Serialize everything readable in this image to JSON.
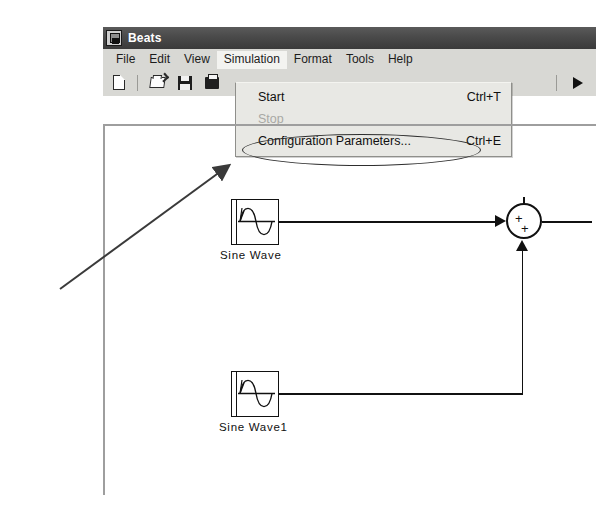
{
  "window": {
    "title": "Beats",
    "title_icon": "simulink-model-icon"
  },
  "menubar": {
    "items": [
      {
        "label": "File",
        "open": false
      },
      {
        "label": "Edit",
        "open": false
      },
      {
        "label": "View",
        "open": false
      },
      {
        "label": "Simulation",
        "open": true
      },
      {
        "label": "Format",
        "open": false
      },
      {
        "label": "Tools",
        "open": false
      },
      {
        "label": "Help",
        "open": false
      }
    ]
  },
  "toolbar": {
    "icons": [
      {
        "name": "new-model-icon",
        "glyph": "new"
      },
      {
        "name": "open-model-icon",
        "glyph": "open"
      },
      {
        "name": "save-model-icon",
        "glyph": "save"
      },
      {
        "name": "print-model-icon",
        "glyph": "print"
      },
      {
        "name": "start-simulation-icon",
        "glyph": "run"
      }
    ]
  },
  "simulation_menu": {
    "items": [
      {
        "label": "Start",
        "accel": "Ctrl+T",
        "disabled": false
      },
      {
        "label": "Stop",
        "accel": "",
        "disabled": true
      },
      {
        "label": "Configuration Parameters...",
        "accel": "Ctrl+E",
        "disabled": false
      }
    ]
  },
  "annotations": {
    "highlight_ellipse_target": "Configuration Parameters...",
    "pointer_arrow": "arrow-pointing-to-configuration-parameters"
  },
  "canvas": {
    "blocks": [
      {
        "name": "sine-wave-block",
        "label": "Sine Wave",
        "type": "Sine Wave"
      },
      {
        "name": "sine-wave1-block",
        "label": "Sine Wave1",
        "type": "Sine Wave"
      },
      {
        "name": "sum-block",
        "label": "",
        "type": "Sum",
        "signs": [
          "+",
          "+"
        ]
      }
    ],
    "signals": [
      {
        "from": "Sine Wave",
        "to": "Sum",
        "port": "input-1"
      },
      {
        "from": "Sine Wave1",
        "to": "Sum",
        "port": "input-2"
      },
      {
        "from": "Sum",
        "to": "",
        "port": "output-1"
      }
    ]
  }
}
